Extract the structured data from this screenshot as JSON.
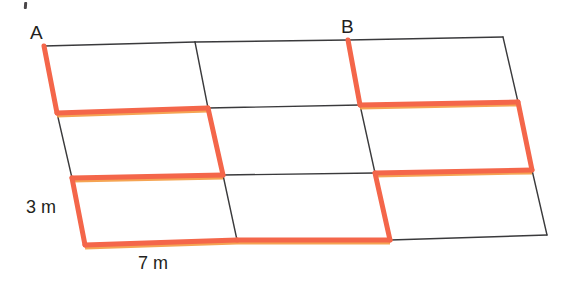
{
  "figure": {
    "type": "geometry-diagram",
    "colors": {
      "outline": "#3a3a3c",
      "highlight": "#f4664a",
      "highlight_edge": "#f5a04a",
      "background": "#ffffff",
      "text": "#231f20"
    },
    "stroke_widths": {
      "outline": 1.4,
      "highlight": 5.0
    },
    "labels": {
      "vertex_a": "A",
      "vertex_b": "B",
      "side_length": "3 m",
      "base_length": "7 m"
    },
    "grid": {
      "rows": 3,
      "columns": 3,
      "cell_width_m": 7,
      "cell_height_m": 3,
      "vertices": [
        [
          [
            44,
            46
          ],
          [
            195,
            42
          ],
          [
            348,
            40
          ],
          [
            503,
            37
          ]
        ],
        [
          [
            57,
            113
          ],
          [
            208,
            108
          ],
          [
            360,
            105
          ],
          [
            518,
            102
          ]
        ],
        [
          [
            72,
            178
          ],
          [
            223,
            175
          ],
          [
            375,
            173
          ],
          [
            532,
            170
          ]
        ],
        [
          [
            85,
            245
          ],
          [
            237,
            240
          ],
          [
            390,
            240
          ],
          [
            547,
            235
          ]
        ]
      ]
    },
    "outline_segments": [
      {
        "name": "top-row1-col1",
        "from": [
          44,
          46
        ],
        "to": [
          195,
          42
        ]
      },
      {
        "name": "top-row1-col2",
        "from": [
          195,
          42
        ],
        "to": [
          348,
          40
        ]
      },
      {
        "name": "top-row1-col3",
        "from": [
          348,
          40
        ],
        "to": [
          503,
          37
        ]
      },
      {
        "name": "vline-col2-row1",
        "from": [
          195,
          42
        ],
        "to": [
          208,
          108
        ]
      },
      {
        "name": "vline-col4-row1",
        "from": [
          503,
          37
        ],
        "to": [
          518,
          102
        ]
      },
      {
        "name": "hline-row2-col1",
        "from": [
          57,
          113
        ],
        "to": [
          208,
          108
        ]
      },
      {
        "name": "hline-row2-col2",
        "from": [
          208,
          108
        ],
        "to": [
          360,
          105
        ]
      },
      {
        "name": "vline-col1-row2",
        "from": [
          57,
          113
        ],
        "to": [
          72,
          178
        ]
      },
      {
        "name": "vline-col3-row2",
        "from": [
          360,
          105
        ],
        "to": [
          375,
          173
        ]
      },
      {
        "name": "hline-row3-col2",
        "from": [
          223,
          175
        ],
        "to": [
          375,
          173
        ]
      },
      {
        "name": "vline-col2-row3",
        "from": [
          223,
          175
        ],
        "to": [
          237,
          240
        ]
      },
      {
        "name": "vline-col4-row3",
        "from": [
          532,
          170
        ],
        "to": [
          547,
          235
        ]
      },
      {
        "name": "bottom-row3-col2",
        "from": [
          237,
          240
        ],
        "to": [
          390,
          240
        ]
      },
      {
        "name": "bottom-row3-col3",
        "from": [
          390,
          240
        ],
        "to": [
          547,
          235
        ]
      }
    ],
    "highlight_segments": [
      {
        "name": "left-edge-row1",
        "from": [
          44,
          46
        ],
        "to": [
          57,
          113
        ]
      },
      {
        "name": "hline-row2-col1-red",
        "from": [
          57,
          113
        ],
        "to": [
          208,
          108
        ]
      },
      {
        "name": "vline-col2-row2-red",
        "from": [
          208,
          108
        ],
        "to": [
          223,
          175
        ]
      },
      {
        "name": "hline-row3-col1-red",
        "from": [
          72,
          178
        ],
        "to": [
          223,
          175
        ]
      },
      {
        "name": "left-edge-row3",
        "from": [
          72,
          178
        ],
        "to": [
          85,
          245
        ]
      },
      {
        "name": "bottom-row3-col1-red",
        "from": [
          85,
          245
        ],
        "to": [
          237,
          240
        ]
      },
      {
        "name": "vline-colB-row1-red",
        "from": [
          348,
          40
        ],
        "to": [
          360,
          105
        ]
      },
      {
        "name": "hline-row2-col3-red",
        "from": [
          360,
          105
        ],
        "to": [
          518,
          102
        ]
      },
      {
        "name": "vline-col4-row2-red",
        "from": [
          518,
          102
        ],
        "to": [
          532,
          170
        ]
      },
      {
        "name": "hline-row3-col3-red",
        "from": [
          375,
          173
        ],
        "to": [
          532,
          170
        ]
      },
      {
        "name": "vline-col3-row3-red",
        "from": [
          375,
          173
        ],
        "to": [
          390,
          240
        ]
      },
      {
        "name": "bottom-row3-col2-partial-red",
        "from": [
          237,
          240
        ],
        "to": [
          390,
          240
        ]
      }
    ]
  }
}
